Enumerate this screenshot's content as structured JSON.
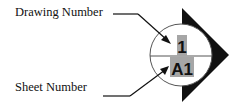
{
  "labels": {
    "drawing_number": "Drawing Number",
    "sheet_number": "Sheet Number"
  },
  "marker": {
    "drawing_number_value": "1",
    "sheet_number_value": "A1",
    "highlight_color": "#a6a6a6",
    "arrow_color": "#111111"
  }
}
